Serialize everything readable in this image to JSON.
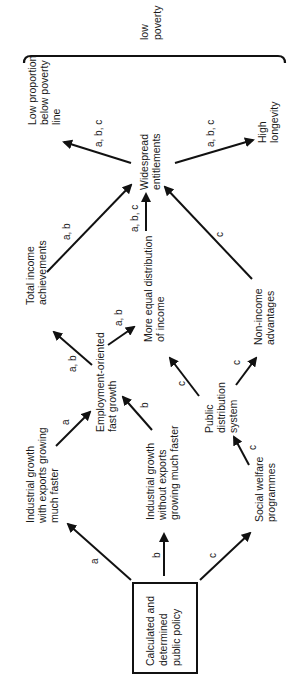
{
  "diagram": {
    "orientation": "rotated 90 degrees counter-clockwise",
    "outcome_group": {
      "label_line1": "low",
      "label_line2": "poverty"
    },
    "nodes": {
      "policy": {
        "lines": [
          "Calculated and",
          "determined",
          "public policy"
        ]
      },
      "ind_with_exports": {
        "lines": [
          "Industrial growth",
          "with exports growing",
          "much faster"
        ]
      },
      "ind_without_exports": {
        "lines": [
          "Industrial growth",
          "without exports",
          "growing much faster"
        ]
      },
      "social_welfare": {
        "lines": [
          "Social welfare",
          "programmes"
        ]
      },
      "employment_growth": {
        "lines": [
          "Employment-oriented",
          "fast growth"
        ]
      },
      "public_distribution": {
        "lines": [
          "Public",
          "distribution",
          "system"
        ]
      },
      "total_income": {
        "lines": [
          "Total income",
          "achievements"
        ]
      },
      "equal_distribution": {
        "lines": [
          "More equal distribution",
          "of income"
        ]
      },
      "non_income": {
        "lines": [
          "Non-income",
          "advantages"
        ]
      },
      "entitlements": {
        "lines": [
          "Widespread",
          "entitlements"
        ]
      },
      "low_proportion": {
        "lines": [
          "Low proportion",
          "below poverty",
          "line"
        ]
      },
      "longevity": {
        "lines": [
          "High",
          "longevity"
        ]
      }
    },
    "edges": [
      {
        "from": "policy",
        "to": "ind_with_exports",
        "label": "a"
      },
      {
        "from": "policy",
        "to": "ind_without_exports",
        "label": "b"
      },
      {
        "from": "policy",
        "to": "social_welfare",
        "label": "c"
      },
      {
        "from": "ind_with_exports",
        "to": "employment_growth",
        "label": "a"
      },
      {
        "from": "ind_without_exports",
        "to": "employment_growth",
        "label": "b"
      },
      {
        "from": "social_welfare",
        "to": "public_distribution",
        "label": "c"
      },
      {
        "from": "employment_growth",
        "to": "total_income",
        "label": "a, b"
      },
      {
        "from": "employment_growth",
        "to": "equal_distribution",
        "label": "a, b"
      },
      {
        "from": "public_distribution",
        "to": "equal_distribution",
        "label": "c"
      },
      {
        "from": "public_distribution",
        "to": "non_income",
        "label": "c"
      },
      {
        "from": "total_income",
        "to": "entitlements",
        "label": "a, b"
      },
      {
        "from": "equal_distribution",
        "to": "entitlements",
        "label": "a, b, c"
      },
      {
        "from": "non_income",
        "to": "entitlements",
        "label": "c"
      },
      {
        "from": "entitlements",
        "to": "low_proportion",
        "label": "a, b, c"
      },
      {
        "from": "entitlements",
        "to": "longevity",
        "label": "a, b, c"
      }
    ]
  }
}
